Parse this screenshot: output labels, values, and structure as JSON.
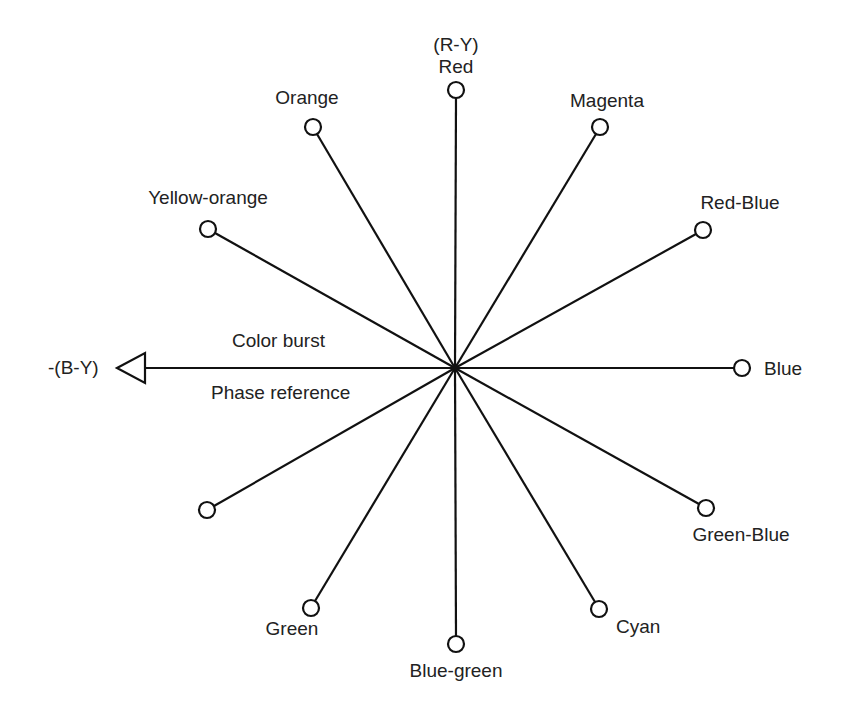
{
  "diagram": {
    "center": {
      "x": 455,
      "y": 368
    },
    "reference": {
      "axis_label": "-(B-Y)",
      "text_above": "Color burst",
      "text_below": "Phase reference"
    },
    "vectors": [
      {
        "name": "Red",
        "sublabel": "(R-Y)",
        "x": 456,
        "y": 90
      },
      {
        "name": "Magenta",
        "x": 600,
        "y": 127
      },
      {
        "name": "Red-Blue",
        "x": 703,
        "y": 230
      },
      {
        "name": "Blue",
        "x": 742,
        "y": 368
      },
      {
        "name": "Green-Blue",
        "x": 706,
        "y": 508
      },
      {
        "name": "Cyan",
        "x": 599,
        "y": 609
      },
      {
        "name": "Blue-green",
        "x": 456,
        "y": 644
      },
      {
        "name": "Green",
        "x": 311,
        "y": 608
      },
      {
        "name": "",
        "x": 207,
        "y": 510
      },
      {
        "name": "Yellow-orange",
        "x": 208,
        "y": 229
      },
      {
        "name": "Orange",
        "x": 313,
        "y": 127
      }
    ],
    "colors": {
      "line": "#111111",
      "text": "#222222",
      "background": "#ffffff"
    }
  }
}
